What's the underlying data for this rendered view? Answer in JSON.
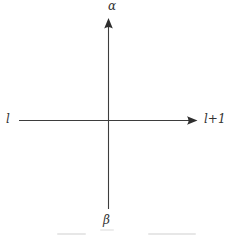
{
  "diagram": {
    "type": "axis-cross",
    "labels": {
      "top": "α",
      "bottom": "β",
      "left": "l",
      "right": "l+1"
    },
    "colors": {
      "axis": "#3d3d3d",
      "label": "#333333",
      "background": "#ffffff"
    }
  }
}
